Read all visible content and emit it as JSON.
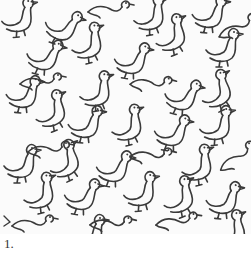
{
  "figure": {
    "stroke_color": "#3a3a3a",
    "background_color": "#fbfbfb",
    "rows": 7,
    "columns": 5
  },
  "caption": {
    "label": "1."
  }
}
